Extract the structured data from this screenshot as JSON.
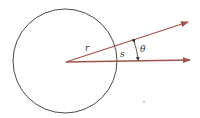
{
  "diagram": {
    "type": "circle-arc-angle",
    "labels": {
      "radius": "r",
      "arc": "s",
      "angle": "θ"
    },
    "colors": {
      "circle": "#4a4a4a",
      "rays": "#a0524a",
      "text": "#333333",
      "background": "#ffffff"
    }
  }
}
